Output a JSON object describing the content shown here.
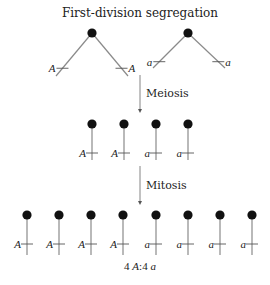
{
  "title": "First-division segregation",
  "colors": {
    "centromere": "#111111",
    "chromatid": "#8a8a8a",
    "text": "#222222"
  },
  "parental_pairs": [
    {
      "centromere": [
        92,
        33
      ],
      "arms": [
        {
          "end": [
            56,
            76
          ],
          "allele": "A",
          "label_side": "left"
        },
        {
          "end": [
            128,
            76
          ],
          "allele": "A",
          "label_side": "right"
        }
      ]
    },
    {
      "centromere": [
        188,
        33
      ],
      "arms": [
        {
          "end": [
            153,
            68
          ],
          "allele": "a",
          "label_side": "left"
        },
        {
          "end": [
            225,
            68
          ],
          "allele": "a",
          "label_side": "right"
        }
      ]
    }
  ],
  "steps": [
    {
      "label": "Meiosis",
      "arrow_x": 140,
      "arrow_y1": 75,
      "arrow_y2": 113,
      "label_x": 146,
      "label_y": 97
    },
    {
      "label": "Mitosis",
      "arrow_x": 140,
      "arrow_y1": 166,
      "arrow_y2": 205,
      "label_x": 146,
      "label_y": 189
    }
  ],
  "meiosis_products": {
    "y_top": 124,
    "y_bottom": 160,
    "tick_y": 153,
    "chromatids": [
      {
        "x": 92,
        "allele": "A"
      },
      {
        "x": 124,
        "allele": "A"
      },
      {
        "x": 156,
        "allele": "a"
      },
      {
        "x": 188,
        "allele": "a"
      }
    ]
  },
  "mitosis_products": {
    "y_top": 215,
    "y_bottom": 255,
    "tick_y": 244,
    "chromatids": [
      {
        "x": 27,
        "allele": "A"
      },
      {
        "x": 59,
        "allele": "A"
      },
      {
        "x": 91,
        "allele": "A"
      },
      {
        "x": 123,
        "allele": "A"
      },
      {
        "x": 156,
        "allele": "a"
      },
      {
        "x": 188,
        "allele": "a"
      },
      {
        "x": 220,
        "allele": "a"
      },
      {
        "x": 252,
        "allele": "a"
      }
    ]
  },
  "ratio": {
    "count_A": "4",
    "allele_A": "A",
    "separator": ":",
    "count_a": "4",
    "allele_a": "a"
  }
}
